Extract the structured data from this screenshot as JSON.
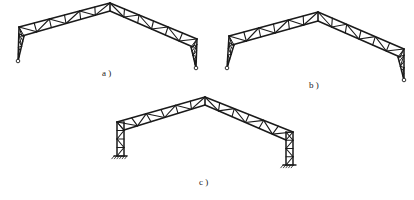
{
  "figure": {
    "stroke_color": "#1a1a1a",
    "background": "#ffffff",
    "panels": [
      {
        "id": "a",
        "label": "a )",
        "support": "pinned",
        "column_type": "tapered truss leg",
        "left_pin": [
          18,
          61
        ],
        "left_eave_top": [
          19,
          27
        ],
        "left_eave_bottom": [
          22,
          36
        ],
        "apex_top": [
          110,
          3
        ],
        "apex_bottom": [
          110,
          11
        ],
        "right_eave_top": [
          197,
          39
        ],
        "right_eave_bottom": [
          193,
          47
        ],
        "right_pin": [
          196,
          68
        ],
        "rafter_panels": 12,
        "label_pos": [
          102,
          68
        ]
      },
      {
        "id": "b",
        "label": "b )",
        "support": "pinned",
        "column_type": "tapered truss leg",
        "left_pin": [
          227,
          68
        ],
        "left_eave_top": [
          229,
          36
        ],
        "left_eave_bottom": [
          232,
          45
        ],
        "apex_top": [
          318,
          12
        ],
        "apex_bottom": [
          318,
          21
        ],
        "right_eave_top": [
          404,
          49
        ],
        "right_eave_bottom": [
          400,
          57
        ],
        "right_pin": [
          404,
          80
        ],
        "rafter_panels": 12,
        "label_pos": [
          309,
          80
        ]
      },
      {
        "id": "c",
        "label": "c )",
        "support": "fixed",
        "column_type": "parallel-chord truss column",
        "left_col_outer_x": 117,
        "left_col_inner_x": 124,
        "left_base_y": 156,
        "left_eave_top_y": 122,
        "apex_top": [
          205,
          97
        ],
        "apex_bottom": [
          205,
          105
        ],
        "right_col_outer_x": 293,
        "right_col_inner_x": 286,
        "right_eave_top_y": 132,
        "right_base_y": 165,
        "rafter_panels": 12,
        "label_pos": [
          199,
          177
        ]
      }
    ]
  }
}
